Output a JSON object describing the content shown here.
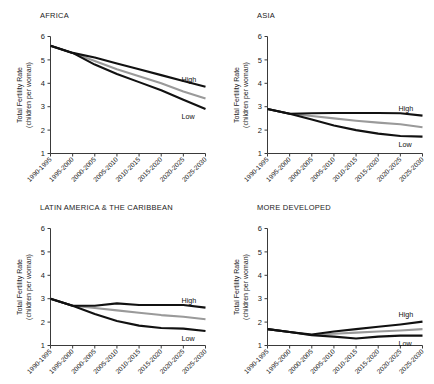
{
  "figure": {
    "ylabel_line1": "Total Fertility Rate",
    "ylabel_line2": "(children per woman)",
    "y_ticks": [
      "6",
      "5",
      "4",
      "3",
      "2",
      "1"
    ],
    "x_ticks": [
      "1990-1995",
      "1995-2000",
      "2000-2005",
      "2005-2010",
      "2010-2015",
      "2015-2020",
      "2020-2025",
      "2025-2030"
    ],
    "label_high": "High",
    "label_low": "Low",
    "color_high_low": "#111111",
    "color_medium": "#9a9a9a",
    "color_axis": "#3a3a3a"
  },
  "panels": [
    {
      "title": "AFRICA"
    },
    {
      "title": "ASIA"
    },
    {
      "title": "LATIN AMERICA & THE CARIBBEAN"
    },
    {
      "title": "MORE DEVELOPED"
    }
  ],
  "chart_data": [
    {
      "type": "line",
      "title": "AFRICA",
      "xlabel": "",
      "ylabel": "Total Fertility Rate (children per woman)",
      "categories": [
        "1990-1995",
        "1995-2000",
        "2000-2005",
        "2005-2010",
        "2010-2015",
        "2015-2020",
        "2020-2025",
        "2025-2030"
      ],
      "ylim": [
        1,
        6
      ],
      "grid": false,
      "legend": "inline-right",
      "series": [
        {
          "name": "High",
          "color": "#111111",
          "values": [
            5.6,
            5.3,
            5.1,
            4.85,
            4.6,
            4.35,
            4.1,
            3.85
          ]
        },
        {
          "name": "Medium",
          "color": "#9a9a9a",
          "values": [
            5.6,
            5.3,
            4.95,
            4.6,
            4.3,
            4.0,
            3.65,
            3.35
          ]
        },
        {
          "name": "Low",
          "color": "#111111",
          "values": [
            5.6,
            5.3,
            4.8,
            4.4,
            4.05,
            3.7,
            3.3,
            2.9
          ]
        }
      ]
    },
    {
      "type": "line",
      "title": "ASIA",
      "xlabel": "",
      "ylabel": "Total Fertility Rate (children per woman)",
      "categories": [
        "1990-1995",
        "1995-2000",
        "2000-2005",
        "2005-2010",
        "2010-2015",
        "2015-2020",
        "2020-2025",
        "2025-2030"
      ],
      "ylim": [
        1,
        6
      ],
      "grid": false,
      "legend": "inline-right",
      "series": [
        {
          "name": "High",
          "color": "#111111",
          "values": [
            2.9,
            2.7,
            2.72,
            2.73,
            2.73,
            2.73,
            2.72,
            2.62
          ]
        },
        {
          "name": "Medium",
          "color": "#9a9a9a",
          "values": [
            2.9,
            2.7,
            2.6,
            2.5,
            2.4,
            2.32,
            2.25,
            2.12
          ]
        },
        {
          "name": "Low",
          "color": "#111111",
          "values": [
            2.9,
            2.7,
            2.45,
            2.2,
            2.0,
            1.85,
            1.75,
            1.72
          ]
        }
      ]
    },
    {
      "type": "line",
      "title": "LATIN AMERICA & THE CARIBBEAN",
      "xlabel": "",
      "ylabel": "Total Fertility Rate (children per woman)",
      "categories": [
        "1990-1995",
        "1995-2000",
        "2000-2005",
        "2005-2010",
        "2010-2015",
        "2015-2020",
        "2020-2025",
        "2025-2030"
      ],
      "ylim": [
        1,
        6
      ],
      "grid": false,
      "legend": "inline-right",
      "series": [
        {
          "name": "High",
          "color": "#111111",
          "values": [
            3.0,
            2.7,
            2.7,
            2.8,
            2.73,
            2.73,
            2.73,
            2.62
          ]
        },
        {
          "name": "Medium",
          "color": "#9a9a9a",
          "values": [
            3.0,
            2.7,
            2.6,
            2.5,
            2.4,
            2.3,
            2.23,
            2.12
          ]
        },
        {
          "name": "Low",
          "color": "#111111",
          "values": [
            3.0,
            2.7,
            2.35,
            2.05,
            1.85,
            1.75,
            1.72,
            1.62
          ]
        }
      ]
    },
    {
      "type": "line",
      "title": "MORE DEVELOPED",
      "xlabel": "",
      "ylabel": "Total Fertility Rate (children per woman)",
      "categories": [
        "1990-1995",
        "1995-2000",
        "2000-2005",
        "2005-2010",
        "2010-2015",
        "2015-2020",
        "2020-2025",
        "2025-2030"
      ],
      "ylim": [
        1,
        6
      ],
      "grid": false,
      "legend": "inline-right",
      "series": [
        {
          "name": "High",
          "color": "#111111",
          "values": [
            1.7,
            1.58,
            1.47,
            1.6,
            1.7,
            1.8,
            1.9,
            2.02
          ]
        },
        {
          "name": "Medium",
          "color": "#9a9a9a",
          "values": [
            1.7,
            1.58,
            1.45,
            1.5,
            1.55,
            1.6,
            1.64,
            1.7
          ]
        },
        {
          "name": "Low",
          "color": "#111111",
          "values": [
            1.7,
            1.58,
            1.44,
            1.38,
            1.3,
            1.38,
            1.42,
            1.42
          ]
        }
      ]
    }
  ]
}
